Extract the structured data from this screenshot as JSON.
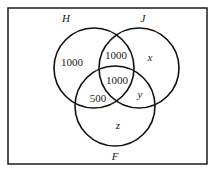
{
  "diagram": {
    "type": "venn",
    "frame": {
      "x": 8,
      "y": 8,
      "width": 199,
      "height": 156
    },
    "sets": [
      {
        "name": "H",
        "cx": 94,
        "cy": 68,
        "r": 40,
        "label_x": 66,
        "label_y": 21
      },
      {
        "name": "J",
        "cx": 139,
        "cy": 68,
        "r": 40,
        "label_x": 143,
        "label_y": 21
      },
      {
        "name": "F",
        "cx": 115,
        "cy": 106,
        "r": 40,
        "label_x": 115,
        "label_y": 160
      }
    ],
    "regions": [
      {
        "id": "H_only",
        "value": "1000",
        "x": 72,
        "y": 66
      },
      {
        "id": "H_and_J_only",
        "value": "1000",
        "x": 116,
        "y": 59
      },
      {
        "id": "H_and_J_and_F",
        "value": "1000",
        "x": 117,
        "y": 83
      },
      {
        "id": "H_and_F_only",
        "value": "500",
        "x": 98,
        "y": 101
      },
      {
        "id": "J_only",
        "value": "x",
        "x": 150,
        "y": 60
      },
      {
        "id": "J_and_F_only",
        "value": "y",
        "x": 140,
        "y": 97
      },
      {
        "id": "F_only",
        "value": "z",
        "x": 118,
        "y": 128
      }
    ]
  },
  "labels": {
    "H": "H",
    "J": "J",
    "F": "F",
    "h_only": "1000",
    "hj": "1000",
    "hjf": "1000",
    "hf": "500",
    "j_only": "x",
    "jf": "y",
    "f_only": "z"
  }
}
